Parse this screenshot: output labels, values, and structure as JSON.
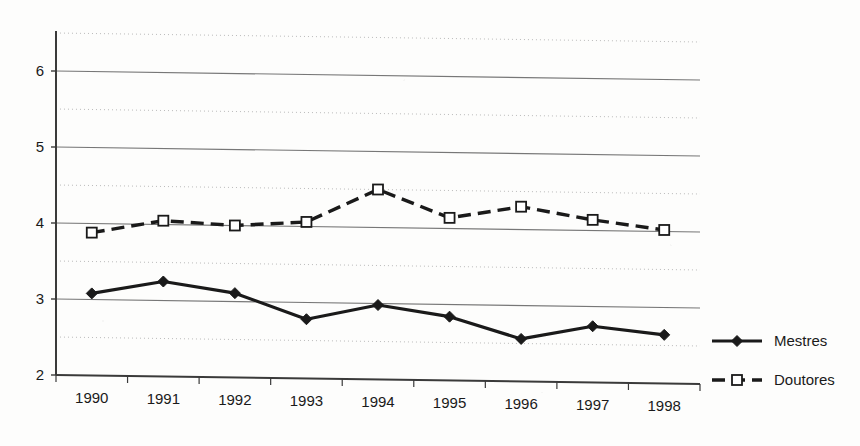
{
  "chart_data": {
    "type": "line",
    "title": "",
    "subtitle": "",
    "xlabel": "",
    "ylabel": "",
    "categories": [
      "1990",
      "1991",
      "1992",
      "1993",
      "1994",
      "1995",
      "1996",
      "1997",
      "1998"
    ],
    "series": [
      {
        "name": "Mestres",
        "marker": "filled-diamond",
        "line_style": "solid",
        "color": "#1a1a1a",
        "values": [
          3.08,
          3.25,
          3.11,
          2.78,
          2.98,
          2.84,
          2.56,
          2.74,
          2.64
        ]
      },
      {
        "name": "Doutores",
        "marker": "open-square",
        "line_style": "dashed",
        "color": "#1a1a1a",
        "values": [
          3.88,
          4.05,
          4.0,
          4.06,
          4.5,
          4.14,
          4.3,
          4.14,
          4.02
        ]
      }
    ],
    "ylim": [
      2,
      6.5
    ],
    "y_major_ticks": [
      2,
      3,
      4,
      5,
      6
    ],
    "y_major_tick_labels": [
      "2",
      "3",
      "4",
      "5",
      "6"
    ],
    "y_minor_ticks": [
      2.5,
      3.5,
      4.5,
      5.5,
      6.5
    ],
    "grid": {
      "major_horizontal": true,
      "minor_horizontal": true,
      "vertical": false,
      "major_color": "#777777",
      "minor_color": "#bbbbbb"
    },
    "legend": {
      "position": "right",
      "entries": [
        "Mestres",
        "Doutores"
      ]
    },
    "axis_color": "#3a3a3a",
    "background": "#fdfdfc"
  }
}
